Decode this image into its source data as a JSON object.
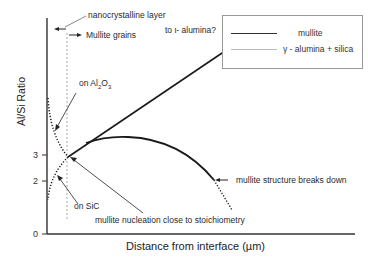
{
  "diagram": {
    "y_axis_label": "Al/Si Ratio",
    "x_axis_label": "Distance from interface (µm)",
    "y_ticks": [
      {
        "label": "3",
        "y": 155
      },
      {
        "label": "2",
        "y": 181
      },
      {
        "label": "0",
        "y": 234
      }
    ],
    "annotations": {
      "nanocrystalline": "nanocrystalline layer",
      "mullite_grains": "Mullite grains",
      "iota_alumina": "to ι- alumina?",
      "on_al2o3_main": "on Al",
      "on_al2o3_sub1": "2",
      "on_al2o3_o": "O",
      "on_al2o3_sub2": "3",
      "on_sic": "on SiC",
      "nucleation": "mullite nucleation close to stoichiometry",
      "breakdown": "mullite structure breaks down"
    },
    "legend": {
      "items": [
        {
          "label": "mullite",
          "style": "solid",
          "color": "#222222"
        },
        {
          "label": "γ - alumina + silica",
          "style": "thin",
          "color": "#bbbbbb"
        }
      ]
    },
    "colors": {
      "line": "#1a1a1a",
      "dotted_guide": "#aaaaaa",
      "axis": "#333333"
    }
  }
}
